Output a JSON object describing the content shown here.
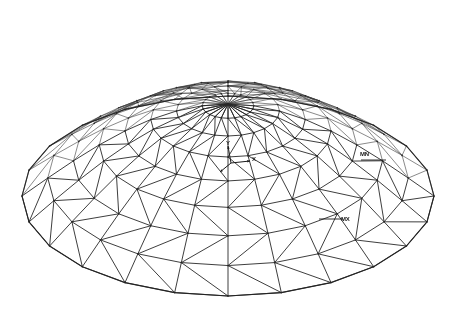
{
  "plot": {
    "type": "fea-wireframe-mesh",
    "title": "",
    "background_color": "#ffffff",
    "line_color": "#3a3a3a",
    "text_color": "#1a1a1a",
    "geometry": {
      "shape": "lattice-dome",
      "description": "Triangulated single-layer radial-ring lattice dome shown as a wireframe in isometric view",
      "rings": 8,
      "radial_sectors": 24,
      "span_px": 412,
      "rise_px": 92,
      "center_x_px": 228,
      "center_y_px": 196,
      "ellipse_rx_px": 206,
      "ellipse_ry_px": 100,
      "view_tilt_deg": 29,
      "hidden_lines_visible": true
    }
  },
  "annotations": [
    {
      "name": "min-marker",
      "label": "MN",
      "x_px": 360,
      "y_px": 151
    },
    {
      "name": "max-marker",
      "label": "MX",
      "x_px": 341,
      "y_px": 216
    }
  ],
  "axis_triad": {
    "origin_x_px": 231,
    "origin_y_px": 163,
    "x_label": "X",
    "y_label": "Y",
    "z_label": "Z",
    "x_tip_x_px": 250,
    "x_tip_y_px": 161,
    "y_tip_x_px": 228,
    "y_tip_y_px": 146,
    "z_tip_x_px": 220,
    "z_tip_y_px": 172
  },
  "chart_data": {
    "type": "line",
    "title": "",
    "xlabel": "X",
    "ylabel": "Y",
    "grid": false,
    "legend": "none"
  }
}
